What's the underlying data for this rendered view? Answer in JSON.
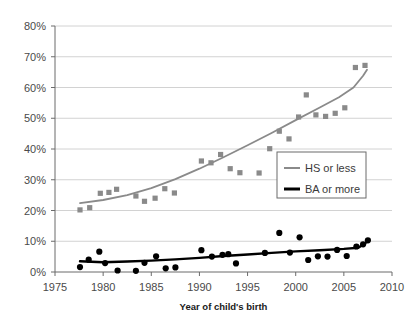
{
  "chart_data": {
    "type": "scatter",
    "title": "",
    "xlabel": "Year of child's birth",
    "ylabel": "",
    "xlim": [
      1975,
      2010
    ],
    "ylim": [
      0,
      0.8
    ],
    "grid": true,
    "legend_position": "center-right",
    "x_ticks": [
      "1975",
      "1980",
      "1985",
      "1990",
      "1995",
      "2000",
      "2005",
      "2010"
    ],
    "x_tick_values": [
      1975,
      1980,
      1985,
      1990,
      1995,
      2000,
      2005,
      2010
    ],
    "y_ticks": [
      "0%",
      "10%",
      "20%",
      "30%",
      "40%",
      "50%",
      "60%",
      "70%",
      "80%"
    ],
    "y_tick_values": [
      0,
      10,
      20,
      30,
      40,
      50,
      60,
      70,
      80
    ],
    "series": [
      {
        "name": "HS or less",
        "color": "#8a8a8a",
        "marker": "square",
        "points": [
          {
            "x": 1977.6,
            "y": 20.2
          },
          {
            "x": 1978.6,
            "y": 20.9
          },
          {
            "x": 1979.7,
            "y": 25.6
          },
          {
            "x": 1980.6,
            "y": 25.9
          },
          {
            "x": 1981.4,
            "y": 26.9
          },
          {
            "x": 1983.4,
            "y": 24.7
          },
          {
            "x": 1984.3,
            "y": 23.0
          },
          {
            "x": 1985.4,
            "y": 24.0
          },
          {
            "x": 1986.4,
            "y": 27.1
          },
          {
            "x": 1987.4,
            "y": 25.7
          },
          {
            "x": 1990.2,
            "y": 36.1
          },
          {
            "x": 1991.2,
            "y": 35.5
          },
          {
            "x": 1992.2,
            "y": 38.2
          },
          {
            "x": 1993.2,
            "y": 33.6
          },
          {
            "x": 1994.2,
            "y": 32.3
          },
          {
            "x": 1996.2,
            "y": 32.2
          },
          {
            "x": 1997.3,
            "y": 40.1
          },
          {
            "x": 1998.3,
            "y": 45.8
          },
          {
            "x": 1999.3,
            "y": 43.3
          },
          {
            "x": 2000.3,
            "y": 50.4
          },
          {
            "x": 2001.1,
            "y": 57.6
          },
          {
            "x": 2002.1,
            "y": 51.1
          },
          {
            "x": 2003.1,
            "y": 50.6
          },
          {
            "x": 2004.1,
            "y": 51.6
          },
          {
            "x": 2005.1,
            "y": 53.4
          },
          {
            "x": 2006.2,
            "y": 66.5
          },
          {
            "x": 2007.2,
            "y": 67.2
          }
        ],
        "trend": [
          {
            "x": 1977.6,
            "y": 22.4
          },
          {
            "x": 1980.0,
            "y": 23.4
          },
          {
            "x": 1982.5,
            "y": 25.0
          },
          {
            "x": 1985.0,
            "y": 27.3
          },
          {
            "x": 1987.5,
            "y": 30.2
          },
          {
            "x": 1990.0,
            "y": 33.6
          },
          {
            "x": 1992.5,
            "y": 37.3
          },
          {
            "x": 1995.0,
            "y": 41.2
          },
          {
            "x": 1997.5,
            "y": 45.2
          },
          {
            "x": 2000.0,
            "y": 49.4
          },
          {
            "x": 2002.5,
            "y": 53.5
          },
          {
            "x": 2004.5,
            "y": 56.8
          },
          {
            "x": 2006.0,
            "y": 60.0
          },
          {
            "x": 2007.0,
            "y": 63.8
          },
          {
            "x": 2007.4,
            "y": 65.8
          }
        ]
      },
      {
        "name": "BA or more",
        "color": "#000000",
        "marker": "circle",
        "points": [
          {
            "x": 1977.6,
            "y": 1.6
          },
          {
            "x": 1978.5,
            "y": 4.0
          },
          {
            "x": 1979.6,
            "y": 6.6
          },
          {
            "x": 1980.2,
            "y": 2.9
          },
          {
            "x": 1981.5,
            "y": 0.5
          },
          {
            "x": 1983.4,
            "y": 0.4
          },
          {
            "x": 1984.3,
            "y": 3.0
          },
          {
            "x": 1985.5,
            "y": 5.1
          },
          {
            "x": 1986.5,
            "y": 1.2
          },
          {
            "x": 1987.5,
            "y": 1.5
          },
          {
            "x": 1990.2,
            "y": 7.1
          },
          {
            "x": 1991.3,
            "y": 5.0
          },
          {
            "x": 1992.4,
            "y": 5.6
          },
          {
            "x": 1993.0,
            "y": 5.8
          },
          {
            "x": 1993.8,
            "y": 2.8
          },
          {
            "x": 1996.8,
            "y": 6.2
          },
          {
            "x": 1998.3,
            "y": 12.7
          },
          {
            "x": 1999.4,
            "y": 6.3
          },
          {
            "x": 2000.4,
            "y": 11.3
          },
          {
            "x": 2001.3,
            "y": 3.9
          },
          {
            "x": 2002.3,
            "y": 5.1
          },
          {
            "x": 2003.3,
            "y": 5.0
          },
          {
            "x": 2004.3,
            "y": 7.2
          },
          {
            "x": 2005.3,
            "y": 5.2
          },
          {
            "x": 2006.3,
            "y": 8.3
          },
          {
            "x": 2007.0,
            "y": 9.0
          },
          {
            "x": 2007.5,
            "y": 10.3
          }
        ],
        "trend": [
          {
            "x": 1977.6,
            "y": 3.5
          },
          {
            "x": 1980.0,
            "y": 3.2
          },
          {
            "x": 1982.5,
            "y": 3.4
          },
          {
            "x": 1985.0,
            "y": 3.7
          },
          {
            "x": 1987.5,
            "y": 4.1
          },
          {
            "x": 1990.0,
            "y": 4.6
          },
          {
            "x": 1992.5,
            "y": 5.2
          },
          {
            "x": 1995.0,
            "y": 5.7
          },
          {
            "x": 1997.5,
            "y": 6.2
          },
          {
            "x": 2000.0,
            "y": 6.7
          },
          {
            "x": 2002.5,
            "y": 7.1
          },
          {
            "x": 2005.0,
            "y": 7.5
          },
          {
            "x": 2006.5,
            "y": 7.9
          },
          {
            "x": 2007.2,
            "y": 9.3
          },
          {
            "x": 2007.6,
            "y": 10.4
          }
        ]
      }
    ],
    "legend": [
      {
        "label": "HS or less",
        "color": "#8a8a8a"
      },
      {
        "label": "BA or more",
        "color": "#000000"
      }
    ]
  }
}
